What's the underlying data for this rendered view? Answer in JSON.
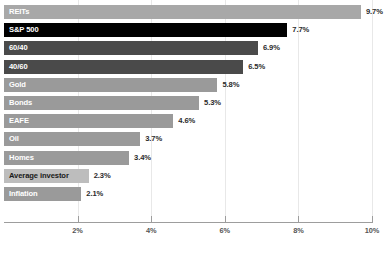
{
  "chart_data": {
    "type": "bar",
    "orientation": "horizontal",
    "title": "",
    "subtitle": "",
    "xlabel": "",
    "ylabel": "",
    "xlim": [
      0,
      10
    ],
    "grid": true,
    "legend": "none",
    "x_ticks": [
      "2%",
      "4%",
      "6%",
      "8%",
      "10%"
    ],
    "x_tick_values": [
      2,
      4,
      6,
      8,
      10
    ],
    "categories": [
      "REITs",
      "S&P 500",
      "60/40",
      "40/60",
      "Gold",
      "Bonds",
      "EAFE",
      "Oil",
      "Homes",
      "Average investor",
      "Inflation"
    ],
    "values": [
      9.7,
      7.7,
      6.9,
      6.5,
      5.8,
      5.3,
      4.6,
      3.7,
      3.4,
      2.3,
      2.1
    ],
    "value_labels": [
      "9.7%",
      "7.7%",
      "6.9%",
      "6.5%",
      "5.8%",
      "5.3%",
      "4.6%",
      "3.7%",
      "3.4%",
      "2.3%",
      "2.1%"
    ],
    "bar_colors": [
      "#a8a8a8",
      "#000000",
      "#4a4a4a",
      "#4a4a4a",
      "#9a9a9a",
      "#9a9a9a",
      "#9a9a9a",
      "#9a9a9a",
      "#9a9a9a",
      "#bdbdbd",
      "#9a9a9a"
    ],
    "label_colors": [
      "#ffffff",
      "#ffffff",
      "#ffffff",
      "#ffffff",
      "#ffffff",
      "#ffffff",
      "#ffffff",
      "#ffffff",
      "#ffffff",
      "#1a1a1a",
      "#ffffff"
    ],
    "value_text_color": "#2b2b2b",
    "gridline_color": "#e8e8e8",
    "axis_color": "#9d9d9d",
    "background_color": "#ffffff"
  }
}
